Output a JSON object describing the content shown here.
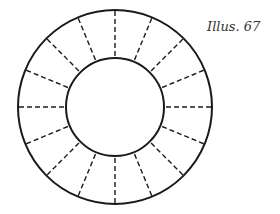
{
  "caption": "Illus. 67",
  "diagram": {
    "type": "annulus-with-radial-divisions",
    "divisions": 16,
    "line_style_divisions": "dashed",
    "stroke_color": "#1a1a1a"
  }
}
